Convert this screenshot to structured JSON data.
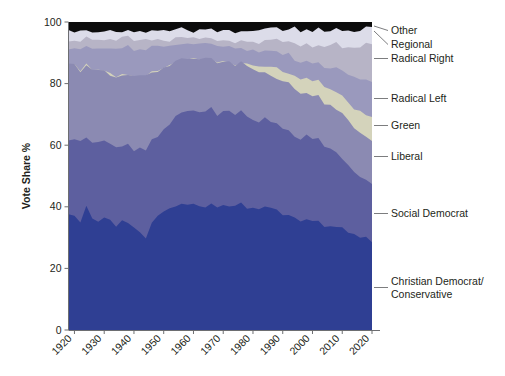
{
  "chart_data": {
    "type": "area",
    "title": "",
    "subtitle": "",
    "xlabel": "",
    "ylabel": "Vote Share %",
    "xlim": [
      1918,
      2020
    ],
    "ylim": [
      0,
      100
    ],
    "grid": false,
    "legend_position": "right-labels-with-leader-lines",
    "stacked": true,
    "stack_order_bottom_to_top": [
      "Christian Democrat/ Conservative",
      "Social Democrat",
      "Liberal",
      "Green",
      "Radical Left",
      "Radical Right",
      "Regional",
      "Other"
    ],
    "xticks": [
      1920,
      1930,
      1940,
      1950,
      1960,
      1970,
      1980,
      1990,
      2000,
      2010,
      2020
    ],
    "yticks": [
      0,
      20,
      40,
      60,
      80,
      100
    ],
    "x": [
      1918,
      1920,
      1922,
      1924,
      1926,
      1928,
      1930,
      1932,
      1934,
      1936,
      1938,
      1940,
      1942,
      1944,
      1946,
      1948,
      1950,
      1952,
      1954,
      1956,
      1958,
      1960,
      1962,
      1964,
      1966,
      1968,
      1970,
      1972,
      1974,
      1976,
      1978,
      1980,
      1982,
      1984,
      1986,
      1988,
      1990,
      1992,
      1994,
      1996,
      1998,
      2000,
      2002,
      2004,
      2006,
      2008,
      2010,
      2012,
      2014,
      2016,
      2018,
      2020
    ],
    "series": [
      {
        "name": "Christian Democrat/ Conservative",
        "color": "#2f3f93",
        "values": [
          38,
          37,
          35,
          40,
          36,
          35,
          37,
          36,
          34,
          36,
          35,
          33,
          32,
          30,
          35,
          37,
          38,
          39,
          40,
          41,
          41,
          41,
          40,
          40,
          41,
          40,
          41,
          40,
          40,
          41,
          40,
          40,
          39,
          40,
          40,
          39,
          38,
          37,
          36,
          35,
          36,
          35,
          36,
          34,
          34,
          34,
          33,
          32,
          31,
          30,
          30,
          29
        ]
      },
      {
        "name": "Social Democrat",
        "color": "#5d5f9f",
        "values": [
          24,
          25,
          26,
          23,
          25,
          26,
          24,
          24,
          25,
          24,
          25,
          25,
          27,
          28,
          27,
          26,
          27,
          28,
          29,
          30,
          30,
          30,
          31,
          31,
          31,
          30,
          30,
          31,
          30,
          30,
          30,
          29,
          29,
          29,
          28,
          28,
          28,
          28,
          27,
          27,
          27,
          27,
          26,
          26,
          25,
          24,
          23,
          22,
          21,
          20,
          19,
          18
        ]
      },
      {
        "name": "Liberal",
        "color": "#8b8ab2",
        "values": [
          24,
          24,
          23,
          23,
          23,
          23,
          23,
          23,
          23,
          23,
          23,
          24,
          24,
          25,
          22,
          21,
          20,
          19,
          18,
          17,
          17,
          17,
          17,
          17,
          16,
          17,
          16,
          16,
          16,
          16,
          16,
          16,
          16,
          15,
          15,
          15,
          15,
          15,
          15,
          15,
          14,
          14,
          14,
          14,
          14,
          14,
          14,
          14,
          14,
          14,
          14,
          14
        ]
      },
      {
        "name": "Green",
        "color": "#d4d3bb",
        "values": [
          0,
          0,
          0,
          0,
          0,
          0,
          0,
          0,
          0,
          0,
          0,
          0,
          0,
          0,
          0,
          0,
          0,
          0,
          0,
          0,
          0,
          0,
          0,
          0,
          0,
          0,
          0,
          0,
          0,
          0,
          0.3,
          1,
          1.5,
          2,
          2.5,
          3,
          3.5,
          3.5,
          4,
          4,
          4.5,
          4.5,
          5,
          5,
          5.5,
          5.5,
          6,
          6,
          6.5,
          7,
          7.5,
          8
        ]
      },
      {
        "name": "Radical Left",
        "color": "#9a99bd",
        "values": [
          5,
          5,
          7,
          6,
          7,
          7,
          7,
          8,
          9,
          9,
          9,
          9,
          8,
          8,
          8,
          8,
          7,
          6,
          6,
          5,
          5,
          5,
          5,
          5,
          5,
          5,
          5,
          5,
          5,
          5,
          5,
          5,
          5,
          5,
          5,
          5,
          5,
          6,
          6,
          6,
          6,
          6,
          6,
          7,
          7,
          8,
          8,
          9,
          10,
          10,
          11,
          11
        ]
      },
      {
        "name": "Radical Right",
        "color": "#b7b4c6",
        "values": [
          3,
          3,
          3,
          3,
          3,
          3,
          3,
          3,
          3,
          3,
          3,
          3,
          3,
          3,
          2,
          2,
          2,
          2,
          2,
          2,
          2,
          2,
          2,
          2,
          2,
          2,
          2,
          2,
          2,
          2,
          2,
          2.5,
          3,
          3,
          3.5,
          4,
          4,
          4.5,
          5,
          5,
          5,
          5.5,
          6,
          6.5,
          7,
          7.5,
          8,
          9,
          10,
          11,
          12,
          13
        ]
      },
      {
        "name": "Regional",
        "color": "#dcdce9",
        "values": [
          3,
          3,
          3,
          2,
          3,
          3,
          3,
          3,
          3,
          2,
          2,
          3,
          3,
          3,
          3,
          3,
          3,
          3,
          3,
          3,
          2,
          2,
          3,
          3,
          3,
          3,
          3,
          3,
          3,
          3,
          4,
          4,
          4,
          4,
          4,
          4,
          4,
          4,
          5,
          5,
          5,
          5,
          5,
          5,
          5,
          5,
          5,
          5,
          5,
          5,
          5,
          5
        ]
      },
      {
        "name": "Other",
        "color": "#0c0c0c",
        "values": [
          3,
          3,
          3,
          3,
          3,
          3,
          3,
          3,
          3,
          3,
          3,
          3,
          3,
          3,
          3,
          3,
          3,
          3,
          2,
          2,
          3,
          3,
          2,
          2,
          2,
          3,
          3,
          3,
          4,
          3,
          3,
          3,
          3,
          2,
          2,
          2,
          3,
          2,
          2,
          3,
          2,
          3,
          2,
          3,
          3,
          2,
          3,
          3,
          3,
          3,
          2,
          2
        ]
      }
    ]
  },
  "axes": {
    "y_title": "Vote Share %",
    "y_ticks": [
      "100",
      "80",
      "60",
      "40",
      "20",
      "0"
    ],
    "x_ticks": [
      "1920",
      "1930",
      "1940",
      "1950",
      "1960",
      "1970",
      "1980",
      "1990",
      "2000",
      "2010",
      "2020"
    ]
  },
  "labels": {
    "other": "Other",
    "regional": "Regional",
    "radical_right": "Radical Right",
    "radical_left": "Radical Left",
    "green": "Green",
    "liberal": "Liberal",
    "social_democrat": "Social Democrat",
    "christian_democrat_line1": "Christian Democrat/",
    "christian_democrat_line2": "Conservative"
  }
}
